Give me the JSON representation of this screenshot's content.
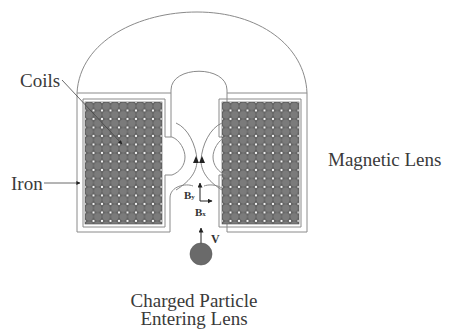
{
  "diagram": {
    "title": "Magnetic Lens",
    "labels": {
      "coils": "Coils",
      "iron": "Iron",
      "magnetic_lens": "Magnetic Lens",
      "particle_line1": "Charged Particle",
      "particle_line2": "Entering Lens",
      "b_y_main": "B",
      "b_y_sub": "y",
      "b_x_main": "B",
      "b_x_sub": "x",
      "velocity": "V"
    },
    "components": [
      {
        "id": "iron-housing",
        "label": "Iron"
      },
      {
        "id": "left-coil-block",
        "label": "Coils"
      },
      {
        "id": "right-coil-block",
        "label": "Coils"
      },
      {
        "id": "charged-particle",
        "label": "Charged Particle Entering Lens"
      }
    ],
    "vectors": [
      {
        "name": "B_y",
        "direction": "up"
      },
      {
        "name": "B_x",
        "direction": "right"
      },
      {
        "name": "V",
        "direction": "up"
      }
    ],
    "colors": {
      "line": "#8a8a8a",
      "coil_fill": "#6e6e6e",
      "coil_dot": "#ffffff",
      "particle": "#6a6a6a",
      "arrow": "#222222",
      "text": "#3a3a3a"
    }
  }
}
